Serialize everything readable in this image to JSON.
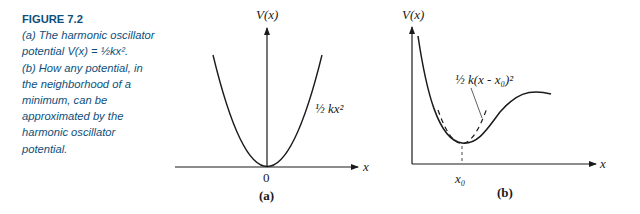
{
  "caption": {
    "figure_label": "FIGURE 7.2",
    "lines": [
      "(a) The harmonic oscillator",
      "potential V(x) = ½kx².",
      "(b) How any potential, in",
      "the neighborhood of a",
      "minimum, can be",
      "approximated by the",
      "harmonic oscillator",
      "potential."
    ]
  },
  "panel_a": {
    "y_axis_label": "V(x)",
    "x_axis_label": "x",
    "origin_label": "0",
    "curve_label": "½ kx²",
    "panel_label": "(a)"
  },
  "panel_b": {
    "y_axis_label": "V(x)",
    "x_axis_label": "x",
    "minimum_label": "x₀",
    "approx_label": "½ k(x - x₀)²",
    "panel_label": "(b)"
  },
  "colors": {
    "caption": "#0d4f7a",
    "ink": "#1a1a1a"
  }
}
